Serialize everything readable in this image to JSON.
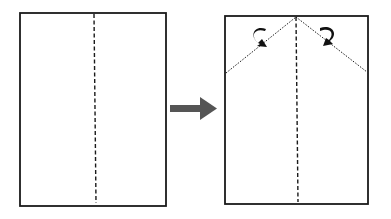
{
  "diagram": {
    "colors": {
      "outline": "#1a1a1a",
      "arrow": "#555555",
      "background": "#ffffff"
    },
    "step1": {
      "label": "",
      "shape": "rectangle",
      "crease": "vertical center dashed line"
    },
    "arrow": {
      "direction": "right",
      "icon": "arrow-right-icon"
    },
    "step2": {
      "label": "",
      "shape": "rectangle",
      "creases": [
        "vertical center dashed line",
        "left diagonal fold line",
        "right diagonal fold line"
      ],
      "fold_arrows": [
        "curved-arrow-left-icon",
        "curved-arrow-right-icon"
      ]
    }
  }
}
